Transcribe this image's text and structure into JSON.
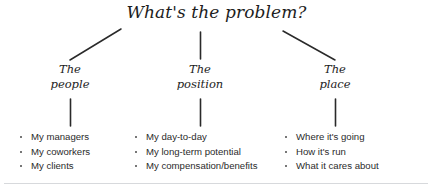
{
  "title": "What's the problem?",
  "colors": {
    "ink": "#1d1d1d",
    "body_text": "#2b2b2b",
    "connector": "#2a2a2a",
    "rule": "#d7d9dc",
    "background": "#ffffff"
  },
  "branches": [
    {
      "id": "people",
      "heading_line1": "The",
      "heading_line2": "people",
      "items": [
        "My managers",
        "My coworkers",
        "My clients"
      ]
    },
    {
      "id": "position",
      "heading_line1": "The",
      "heading_line2": "position",
      "items": [
        "My day-to-day",
        "My long-term potential",
        "My compensation/benefits"
      ]
    },
    {
      "id": "place",
      "heading_line1": "The",
      "heading_line2": "place",
      "items": [
        "Where it's going",
        "How it's run",
        "What it cares about"
      ]
    }
  ]
}
